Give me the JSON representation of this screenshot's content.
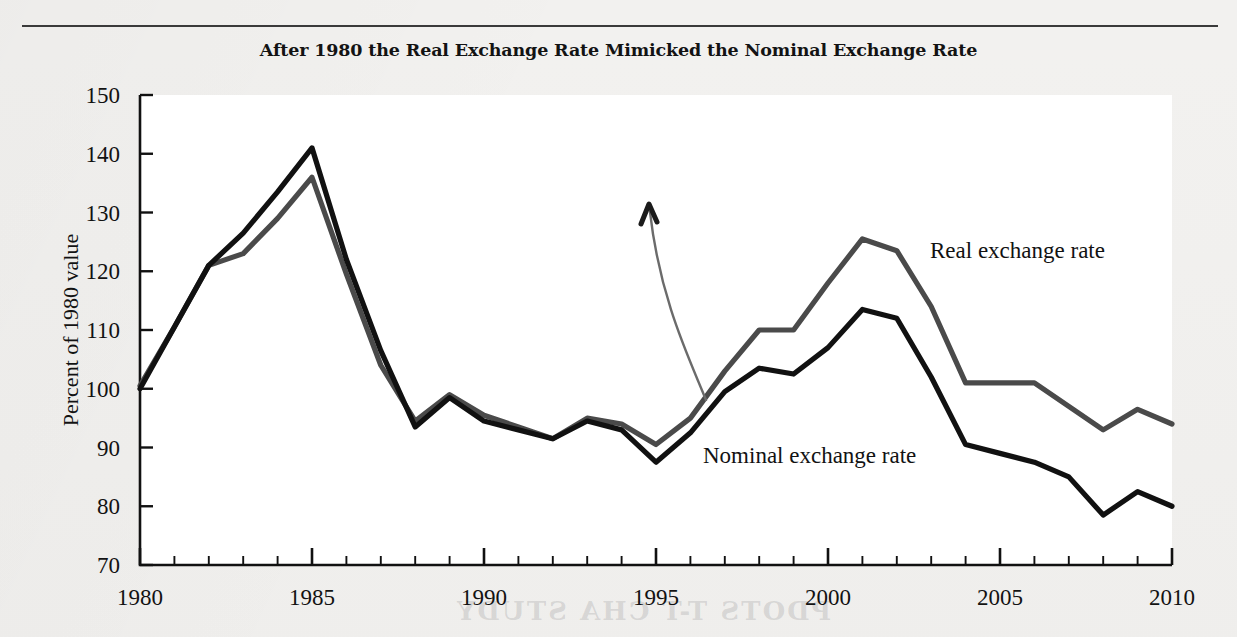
{
  "figure": {
    "title": "After 1980 the Real Exchange Rate Mimicked the Nominal Exchange Rate",
    "bleed_text": "PDOTS T-T CHA STUDY",
    "colors": {
      "page_background": "#f2f1ef",
      "plot_background": "#ffffff",
      "axis": "#111111",
      "nominal_series": "#111111",
      "real_series": "#4a4a4a",
      "annotation_arrow": "#6b6b6b"
    }
  },
  "annotations": {
    "arrow": {
      "name": "curved-up-arrow",
      "description": "curved arrow pointing up where the two series diverge after 1995"
    }
  },
  "chart_data": {
    "type": "line",
    "title": "After 1980 the Real Exchange Rate Mimicked the Nominal Exchange Rate",
    "xlabel": "",
    "ylabel": "Percent of 1980 value",
    "xlim": [
      1980,
      2010
    ],
    "ylim": [
      70,
      150
    ],
    "xticks": [
      1980,
      1985,
      1990,
      1995,
      2000,
      2005,
      2010
    ],
    "xtick_labels": [
      "1980",
      "1985",
      "1990",
      "1995",
      "2000",
      "2005",
      "2010"
    ],
    "xminor_step": 1,
    "yticks": [
      70,
      80,
      90,
      100,
      110,
      120,
      130,
      140,
      150
    ],
    "ytick_labels": [
      "70",
      "80",
      "90",
      "100",
      "110",
      "120",
      "130",
      "140",
      "150"
    ],
    "grid": false,
    "legend": "inline-labels",
    "x": [
      1980,
      1981,
      1982,
      1983,
      1984,
      1985,
      1986,
      1987,
      1988,
      1989,
      1990,
      1991,
      1992,
      1993,
      1994,
      1995,
      1996,
      1997,
      1998,
      1999,
      2000,
      2001,
      2002,
      2003,
      2004,
      2005,
      2006,
      2007,
      2008,
      2009,
      2010
    ],
    "series": [
      {
        "name": "Nominal exchange rate",
        "label": "Nominal exchange rate",
        "color": "#111111",
        "values": [
          100.0,
          110.5,
          121.0,
          126.5,
          133.5,
          141.0,
          122.0,
          106.5,
          93.5,
          98.5,
          94.5,
          93.0,
          91.5,
          94.5,
          93.0,
          87.5,
          92.5,
          99.5,
          103.5,
          102.5,
          107.0,
          113.5,
          112.0,
          102.0,
          90.5,
          89.0,
          87.5,
          85.0,
          78.5,
          82.5,
          80.0
        ]
      },
      {
        "name": "Real exchange rate",
        "label": "Real exchange rate",
        "color": "#4a4a4a",
        "values": [
          100.5,
          110.5,
          121.0,
          123.0,
          129.0,
          136.0,
          119.5,
          104.0,
          94.5,
          99.0,
          95.5,
          93.5,
          91.5,
          95.0,
          94.0,
          90.5,
          95.0,
          103.0,
          110.0,
          110.0,
          118.0,
          125.5,
          123.5,
          114.0,
          101.0,
          101.0,
          101.0,
          97.0,
          93.0,
          96.5,
          94.0
        ]
      }
    ]
  }
}
